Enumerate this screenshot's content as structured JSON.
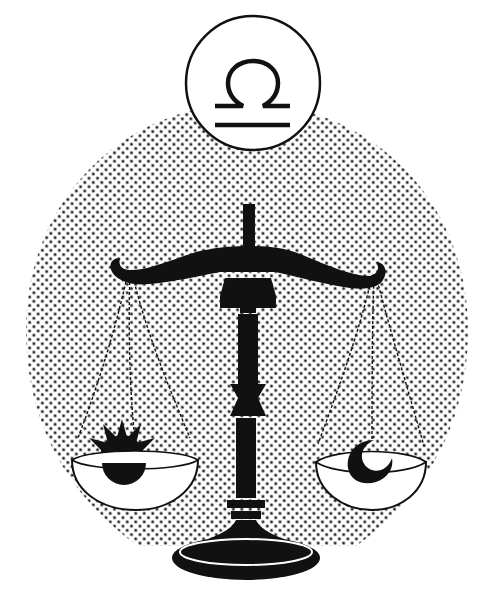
{
  "illustration": {
    "subject": "Libra zodiac scale",
    "glyph": "♎",
    "left_pan_symbol": "sun",
    "right_pan_symbol": "crescent moon",
    "colors": {
      "ink": "#111111",
      "paper": "#ffffff",
      "halftone": "#2a2a2a"
    }
  }
}
